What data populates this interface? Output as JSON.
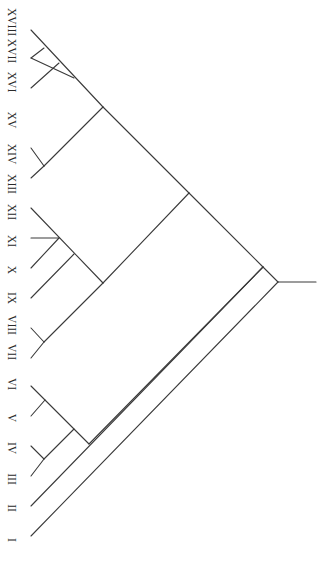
{
  "diagram": {
    "type": "dendrogram",
    "orientation": "root-right, leaves-left, labels rotated 90deg",
    "line_color": "#3a3a3a",
    "label_color": "#2a2a2a",
    "root": {
      "x": 278,
      "y": 282,
      "stem_end_x": 316
    },
    "leaves": [
      {
        "id": "XVIII",
        "label": "XVIII",
        "tip": [
          31,
          30
        ],
        "label_y": 22
      },
      {
        "id": "XVII",
        "label": "XVII",
        "tip": [
          31,
          58
        ],
        "label_y": 51
      },
      {
        "id": "XVI",
        "label": "XVI",
        "tip": [
          31,
          88
        ],
        "label_y": 82
      },
      {
        "id": "XV",
        "label": "XV",
        "tip": [
          31,
          118
        ],
        "label_y": 120
      },
      {
        "id": "XIV",
        "label": "XIV",
        "tip": [
          31,
          148
        ],
        "label_y": 154
      },
      {
        "id": "XIII",
        "label": "XIII",
        "tip": [
          31,
          178
        ],
        "label_y": 184
      },
      {
        "id": "XII",
        "label": "XII",
        "tip": [
          31,
          208
        ],
        "label_y": 212
      },
      {
        "id": "XI",
        "label": "XI",
        "tip": [
          31,
          238
        ],
        "label_y": 241
      },
      {
        "id": "X",
        "label": "X",
        "tip": [
          31,
          268
        ],
        "label_y": 270
      },
      {
        "id": "IX",
        "label": "IX",
        "tip": [
          31,
          298
        ],
        "label_y": 298
      },
      {
        "id": "VIII",
        "label": "VIII",
        "tip": [
          31,
          328
        ],
        "label_y": 325
      },
      {
        "id": "VII",
        "label": "VII",
        "tip": [
          31,
          358
        ],
        "label_y": 352
      },
      {
        "id": "VI",
        "label": "VI",
        "tip": [
          31,
          386
        ],
        "label_y": 384
      },
      {
        "id": "V",
        "label": "V",
        "tip": [
          31,
          416
        ],
        "label_y": 418
      },
      {
        "id": "IV",
        "label": "IV",
        "tip": [
          31,
          446
        ],
        "label_y": 448
      },
      {
        "id": "III",
        "label": "III",
        "tip": [
          31,
          476
        ],
        "label_y": 479
      },
      {
        "id": "II",
        "label": "II",
        "tip": [
          31,
          506
        ],
        "label_y": 508
      },
      {
        "id": "I",
        "label": "I",
        "tip": [
          31,
          536
        ],
        "label_y": 540
      }
    ],
    "edges": [
      [
        278,
        282,
        316,
        282
      ],
      [
        31,
        536,
        278,
        282
      ],
      [
        278,
        282,
        263,
        267
      ],
      [
        31,
        506,
        263,
        267
      ],
      [
        263,
        267,
        189,
        193
      ],
      [
        189,
        193,
        103,
        107
      ],
      [
        103,
        107,
        31,
        30
      ],
      [
        74,
        78,
        31,
        58
      ],
      [
        59,
        63,
        31,
        88
      ],
      [
        44,
        48,
        31,
        58
      ],
      [
        103,
        107,
        44,
        166
      ],
      [
        44,
        166,
        31,
        148
      ],
      [
        44,
        166,
        31,
        178
      ],
      [
        189,
        193,
        103,
        283
      ],
      [
        103,
        283,
        31,
        208
      ],
      [
        74,
        254,
        31,
        298
      ],
      [
        59,
        238,
        31,
        268
      ],
      [
        59,
        238,
        31,
        238
      ],
      [
        103,
        283,
        44,
        342
      ],
      [
        44,
        342,
        31,
        328
      ],
      [
        44,
        342,
        31,
        358
      ],
      [
        263,
        267,
        89,
        444
      ],
      [
        89,
        444,
        31,
        386
      ],
      [
        45,
        400,
        31,
        416
      ],
      [
        74,
        429,
        44,
        459
      ],
      [
        44,
        459,
        31,
        446
      ],
      [
        44,
        459,
        31,
        476
      ]
    ]
  }
}
